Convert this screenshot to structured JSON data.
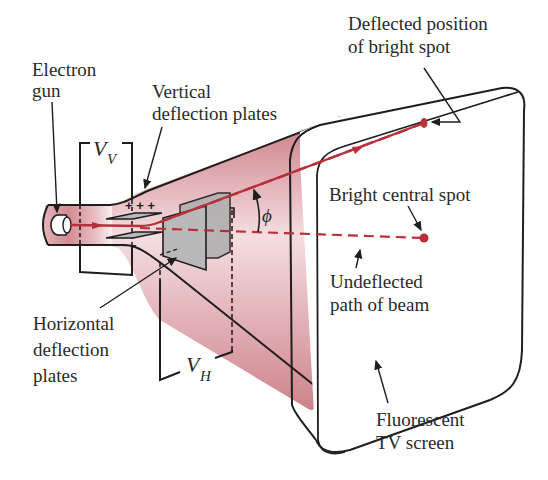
{
  "diagram": {
    "labels": {
      "electron_gun": [
        "Electron",
        "gun"
      ],
      "vertical_plates": [
        "Vertical",
        "deflection plates"
      ],
      "deflected_spot": [
        "Deflected position",
        "of bright spot"
      ],
      "central_spot": "Bright central spot",
      "undeflected_path": [
        "Undeflected",
        "path of beam"
      ],
      "horizontal_plates": [
        "Horizontal",
        "deflection",
        "plates"
      ],
      "screen": [
        "Fluorescent",
        "TV screen"
      ]
    },
    "symbols": {
      "vv_main": "V",
      "vv_sub": "V",
      "vh_main": "V",
      "vh_sub": "H",
      "angle": "ϕ",
      "plus_charges": "+ + +",
      "minus_charges": "– – –"
    },
    "colors": {
      "beam": "#b8303a",
      "tube_fill": "#d9959c",
      "tube_fill_light": "#f6e3e5",
      "plate_fill": "#b9b9b9",
      "outline": "#1e1e1e",
      "text": "#2a2a2a"
    }
  }
}
